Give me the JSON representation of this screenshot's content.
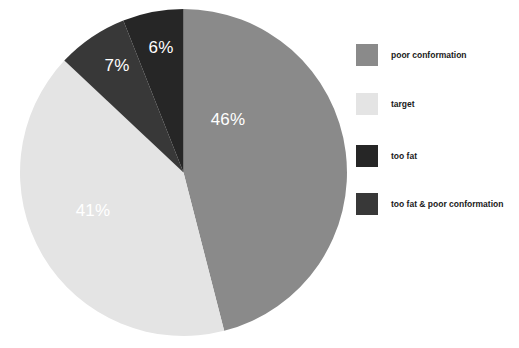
{
  "chart_data": {
    "type": "pie",
    "title": "",
    "categories": [
      "poor conformation",
      "target",
      "too fat",
      "too fat & poor conformation"
    ],
    "values": [
      46,
      41,
      6,
      7
    ],
    "value_labels": [
      "46%",
      "41%",
      "7%",
      "6%"
    ],
    "colors": [
      "#8a8a8a",
      "#e4e4e4",
      "#262626",
      "#383838"
    ],
    "legend_position": "right",
    "grid": false,
    "start_angle_deg": 0,
    "direction": "clockwise",
    "slices": [
      {
        "label": "poor conformation",
        "value": 46,
        "display": "46%",
        "color": "#8a8a8a",
        "label_x": 228,
        "label_y": 120,
        "label_color": "#ffffff"
      },
      {
        "label": "target",
        "value": 41,
        "display": "41%",
        "color": "#e4e4e4",
        "label_x": 93,
        "label_y": 211,
        "label_color": "#ffffff"
      },
      {
        "label": "too fat & poor conformation",
        "value": 7,
        "display": "7%",
        "color": "#383838",
        "label_x": 117,
        "label_y": 66,
        "label_color": "#ffffff"
      },
      {
        "label": "too fat",
        "value": 6,
        "display": "6%",
        "color": "#262626",
        "label_x": 161,
        "label_y": 48,
        "label_color": "#ffffff"
      }
    ]
  },
  "legend": {
    "items": [
      {
        "label": "poor conformation",
        "color": "#8a8a8a",
        "top": 0
      },
      {
        "label": "target",
        "color": "#e4e4e4",
        "top": 49
      },
      {
        "label": "too fat",
        "color": "#262626",
        "top": 101
      },
      {
        "label": "too fat & poor conformation",
        "color": "#383838",
        "top": 149
      }
    ]
  }
}
